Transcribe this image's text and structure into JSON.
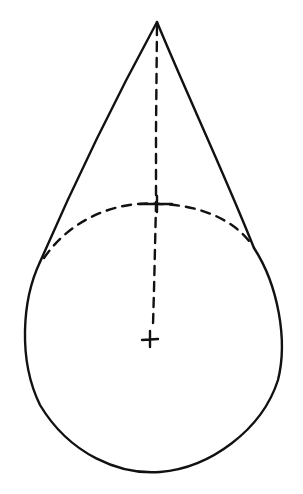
{
  "diagram": {
    "title": "",
    "colors": {
      "ink": "#111111",
      "background": "#ffffff"
    },
    "apex": {
      "x": 157,
      "y": 22
    },
    "circle": {
      "cx": 152,
      "cy": 340,
      "r": 131
    },
    "center_mark": {
      "x": 150,
      "y": 338,
      "symbol": "+"
    },
    "upper_mark": {
      "x": 157,
      "y": 205,
      "symbol": "+"
    },
    "tangent_points": {
      "left": {
        "x": 40,
        "y": 262
      },
      "right": {
        "x": 254,
        "y": 248
      }
    },
    "labels": []
  }
}
